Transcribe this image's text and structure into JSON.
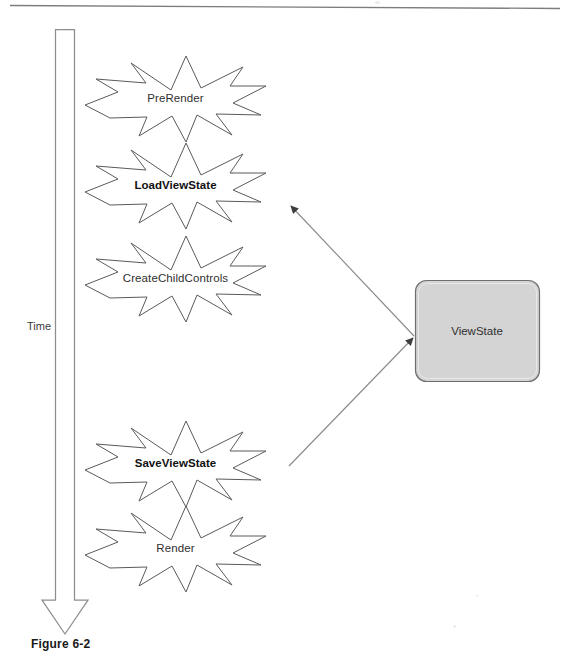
{
  "figure": {
    "caption": "Figure 6-2",
    "axis": {
      "label": "Time",
      "direction": "downward-arrow"
    },
    "lifecycle_nodes": [
      {
        "id": "prerender",
        "label": "PreRender",
        "emphasis": "normal"
      },
      {
        "id": "loadviewstate",
        "label": "LoadViewState",
        "emphasis": "bold"
      },
      {
        "id": "createchildcontrols",
        "label": "CreateChildControls",
        "emphasis": "normal"
      },
      {
        "id": "saveviewstate",
        "label": "SaveViewState",
        "emphasis": "bold"
      },
      {
        "id": "render",
        "label": "Render",
        "emphasis": "normal"
      }
    ],
    "store": {
      "id": "viewstate",
      "label": "ViewState",
      "fill": "#d4d4d4",
      "stroke": "#6f6f6f"
    },
    "connections": [
      {
        "id": "viewstate-to-loadviewstate",
        "from": "viewstate",
        "to": "loadviewstate",
        "arrow_at": "loadviewstate"
      },
      {
        "id": "saveviewstate-to-viewstate",
        "from": "saveviewstate",
        "to": "viewstate",
        "arrow_at": "viewstate"
      }
    ],
    "colors": {
      "outline": "#5a5a5a",
      "rule": "#7d7d7d",
      "arrow": "#3d3d3d",
      "arrow_shaft": "#8a8a8a"
    }
  }
}
